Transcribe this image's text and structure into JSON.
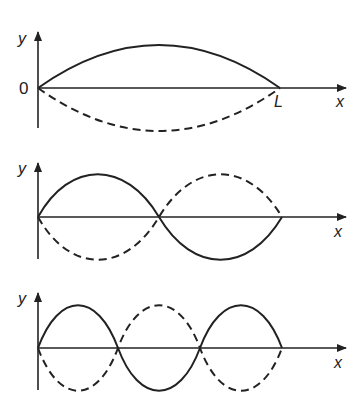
{
  "diagram": {
    "panels": [
      {
        "harmonic": 1,
        "y_label": "y",
        "x_label": "x",
        "origin_label": "0",
        "end_label": "L",
        "nodes": 2,
        "antinodes": 1
      },
      {
        "harmonic": 2,
        "y_label": "y",
        "x_label": "x",
        "nodes": 3,
        "antinodes": 2
      },
      {
        "harmonic": 3,
        "y_label": "y",
        "x_label": "x",
        "nodes": 4,
        "antinodes": 3
      }
    ],
    "legend": {
      "solid": "string displacement at one extreme",
      "dashed": "displacement half a period later"
    },
    "colors": {
      "line": "#222222",
      "background": "#ffffff"
    }
  }
}
